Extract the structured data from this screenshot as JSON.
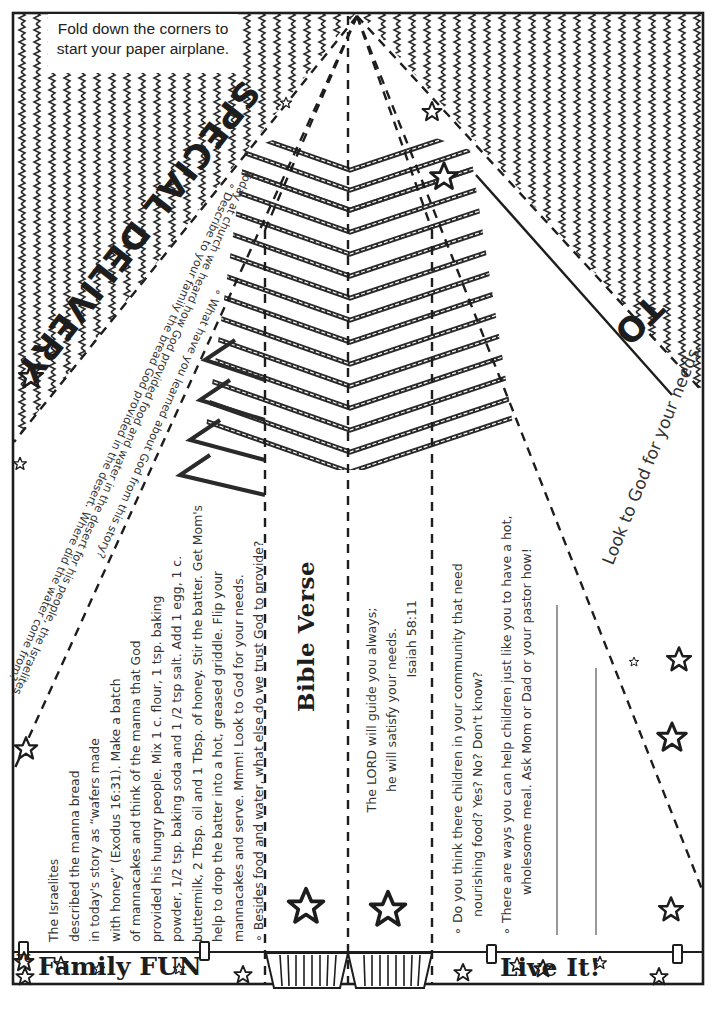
{
  "page": {
    "page_number": "76",
    "instruction": "Fold down the corners to start your paper airplane."
  },
  "header": {
    "special_delivery": "SPECIAL DELIVERY",
    "to_label": "TO",
    "look_to_god": "Look to God for your needs."
  },
  "questions": {
    "intro": "Today at church we heard how God provided food and water in the desert for his people, the Israelites.",
    "q1": "∘ Describe to your family the bread God provided in the desert. Where did the water come from?",
    "q2": "∘ What have you learned about God from this story?"
  },
  "family_fun": {
    "title": "Family FUN",
    "lines": [
      "The Israelites",
      "described the manna bread",
      "in today's story as “wafers made",
      "with honey” (Exodus 16:31). Make a batch",
      "of mannacakes and think of the manna that God",
      "provided his hungry people.  Mix 1 c. flour, 1 tsp. baking",
      "powder, 1/2 tsp. baking soda and 1 /2 tsp salt. Add 1 egg, 1 c.",
      "buttermilk, 2 Tbsp. oil and 1 Tbsp. of honey. Stir the batter. Get Mom's",
      "help to drop the batter into a hot, greased griddle. Flip your",
      "mannacakes and serve. Mmm! Look to God for your needs.",
      "∘ Besides food and water, what else do we trust God to provide?"
    ]
  },
  "bible_verse": {
    "title": "Bible Verse",
    "line1": "The LORD will guide you always;",
    "line2": "he will satisfy your needs.",
    "reference": "Isaiah 58:11"
  },
  "live_it": {
    "title": "Live It!",
    "q1_line1": "∘ Do you think there children in your community that need",
    "q1_line2": "nourishing food? Yes? No? Don't know?",
    "q2_line1": "∘ There are ways you can help children just like you to have a hot,",
    "q2_line2": "wholesome meal. Ask Mom or Dad or your pastor how!"
  },
  "colors": {
    "ink": "#1d1d1d",
    "paper": "#ffffff",
    "text": "#333333"
  }
}
